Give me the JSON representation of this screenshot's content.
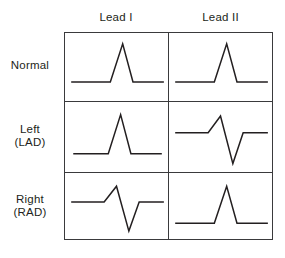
{
  "figure": {
    "stroke_color": "#231f20",
    "grid_color": "#3a3a3c",
    "background_color": "#ffffff"
  },
  "columns": [
    {
      "id": "lead1",
      "label": "Lead I"
    },
    {
      "id": "lead2",
      "label": "Lead II"
    }
  ],
  "rows": [
    {
      "id": "normal",
      "label": "Normal",
      "sublabel": ""
    },
    {
      "id": "left",
      "label": "Left",
      "sublabel": "(LAD)"
    },
    {
      "id": "right",
      "label": "Right",
      "sublabel": "(RAD)"
    }
  ],
  "chart_data": {
    "type": "line",
    "xlabel": "",
    "ylabel": "",
    "grid": true,
    "legend": "none",
    "xlim": [
      0,
      100
    ],
    "ylim": [
      0,
      100
    ],
    "panels": [
      {
        "row": "normal",
        "column": "lead1",
        "deflection": "positive",
        "description": "Tall upright R wave on a flat baseline, no negative deflection",
        "points": [
          [
            6,
            72
          ],
          [
            44,
            72
          ],
          [
            56,
            16
          ],
          [
            66,
            72
          ],
          [
            96,
            72
          ]
        ]
      },
      {
        "row": "normal",
        "column": "lead2",
        "deflection": "positive",
        "description": "Tall upright R wave on a flat baseline, no negative deflection",
        "points": [
          [
            6,
            72
          ],
          [
            44,
            72
          ],
          [
            56,
            16
          ],
          [
            66,
            72
          ],
          [
            96,
            72
          ]
        ]
      },
      {
        "row": "left",
        "column": "lead1",
        "deflection": "positive",
        "description": "Tall upright R wave on a flat baseline, no negative deflection",
        "points": [
          [
            8,
            74
          ],
          [
            42,
            74
          ],
          [
            54,
            18
          ],
          [
            64,
            74
          ],
          [
            94,
            74
          ]
        ]
      },
      {
        "row": "left",
        "column": "lead2",
        "deflection": "negative",
        "description": "Small upward R spike followed by a deep negative S wave below the baseline",
        "points": [
          [
            6,
            44
          ],
          [
            38,
            44
          ],
          [
            50,
            20
          ],
          [
            62,
            88
          ],
          [
            72,
            44
          ],
          [
            96,
            44
          ]
        ]
      },
      {
        "row": "right",
        "column": "lead1",
        "deflection": "negative",
        "description": "Small upward R spike followed by a deep negative S wave below the baseline",
        "points": [
          [
            6,
            44
          ],
          [
            38,
            44
          ],
          [
            50,
            20
          ],
          [
            62,
            88
          ],
          [
            72,
            44
          ],
          [
            96,
            44
          ]
        ]
      },
      {
        "row": "right",
        "column": "lead2",
        "deflection": "positive",
        "description": "Tall upright R wave on a flat baseline, no negative deflection",
        "points": [
          [
            6,
            76
          ],
          [
            44,
            76
          ],
          [
            56,
            20
          ],
          [
            66,
            76
          ],
          [
            96,
            76
          ]
        ]
      }
    ]
  }
}
